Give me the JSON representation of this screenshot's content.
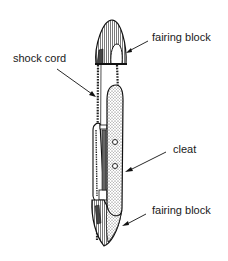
{
  "diagram": {
    "labels": {
      "top_fairing_block": "fairing block",
      "shock_cord": "shock cord",
      "cleat": "cleat",
      "bottom_fairing_block": "fairing block"
    }
  }
}
